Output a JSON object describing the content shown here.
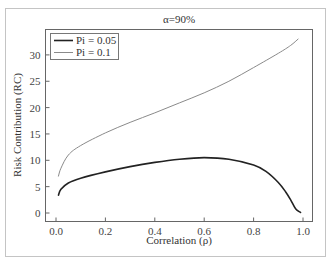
{
  "chart_data": {
    "type": "line",
    "title": "α=90%",
    "xlabel": "Correlation (ρ)",
    "ylabel": "Risk Contribution  (RC)",
    "xlim": [
      -0.05,
      1.04
    ],
    "ylim": [
      -1.7,
      35.0
    ],
    "xticks": [
      0.0,
      0.2,
      0.4,
      0.6,
      0.8,
      1.0
    ],
    "xtick_labels": [
      "0.0",
      "0.2",
      "0.4",
      "0.6",
      "0.8",
      "1.0"
    ],
    "yticks": [
      0,
      5,
      10,
      15,
      20,
      25,
      30
    ],
    "ytick_labels": [
      "0",
      "5",
      "10",
      "15",
      "20",
      "25",
      "30"
    ],
    "grid": false,
    "legend_position": "upper left",
    "series": [
      {
        "name": "Pi = 0.05",
        "color": "#222222",
        "width": 1.6,
        "x": [
          0.01,
          0.02,
          0.05,
          0.1,
          0.2,
          0.3,
          0.4,
          0.5,
          0.6,
          0.7,
          0.8,
          0.85,
          0.9,
          0.93,
          0.95,
          0.97,
          0.99
        ],
        "y": [
          3.4,
          4.5,
          5.7,
          6.6,
          7.8,
          8.8,
          9.6,
          10.2,
          10.5,
          10.2,
          9.1,
          7.9,
          5.8,
          4.0,
          2.5,
          0.8,
          0.1
        ]
      },
      {
        "name": "Pi = 0.1",
        "color": "#8a8a8a",
        "width": 1.0,
        "x": [
          0.01,
          0.02,
          0.05,
          0.1,
          0.2,
          0.3,
          0.4,
          0.5,
          0.6,
          0.7,
          0.8,
          0.9,
          0.95,
          0.98
        ],
        "y": [
          7.0,
          8.5,
          11.0,
          12.8,
          15.2,
          17.2,
          19.0,
          20.9,
          22.8,
          25.0,
          27.6,
          30.3,
          31.8,
          33.0
        ]
      }
    ]
  },
  "colors": {
    "frame": "#bdbdbd",
    "axes": "#555555",
    "text": "#333333"
  }
}
